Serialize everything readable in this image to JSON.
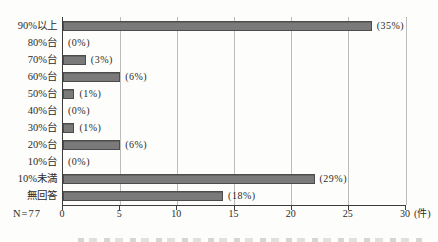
{
  "chart_data": {
    "type": "bar",
    "orientation": "horizontal",
    "title": "",
    "xlabel": "",
    "ylabel": "",
    "categories": [
      "90%以上",
      "80%台",
      "70%台",
      "60%台",
      "50%台",
      "40%台",
      "30%台",
      "20%台",
      "10%台",
      "10%未満",
      "無回答"
    ],
    "values": [
      27,
      0,
      2,
      5,
      1,
      0,
      1,
      5,
      0,
      22,
      14
    ],
    "value_labels": [
      "(35%)",
      "(0%)",
      "(3%)",
      "(6%)",
      "(1%)",
      "(0%)",
      "(1%)",
      "(6%)",
      "(0%)",
      "(29%)",
      "(18%)"
    ],
    "percentages": [
      35,
      0,
      3,
      6,
      1,
      0,
      1,
      6,
      0,
      29,
      18
    ],
    "n_label": "N=77",
    "x_unit": "(件)",
    "xlim": [
      0,
      30
    ],
    "x_ticks": [
      0,
      5,
      10,
      15,
      20,
      25,
      30
    ],
    "grid": true,
    "legend": "none",
    "colors": {
      "bar_fill": "#7a7a7a",
      "bar_border": "#4c4c4c",
      "axis": "#3c3c3c",
      "gridline": "#bcbcbc",
      "text": "#2b2b2b",
      "background": "#fdfdfb"
    }
  }
}
